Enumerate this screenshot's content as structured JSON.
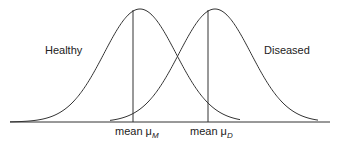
{
  "diagram": {
    "labels": {
      "healthy": "Healthy",
      "diseased": "Diseased",
      "mean_prefix": "mean",
      "mu": "μ",
      "healthy_sub": "M",
      "diseased_sub": "D"
    },
    "colors": {
      "line": "#333333",
      "background": "#ffffff"
    },
    "curves": [
      {
        "name": "Healthy distribution",
        "peak_x": 140,
        "mean_line_x": 133
      },
      {
        "name": "Diseased distribution",
        "peak_x": 215,
        "mean_line_x": 208
      }
    ]
  }
}
